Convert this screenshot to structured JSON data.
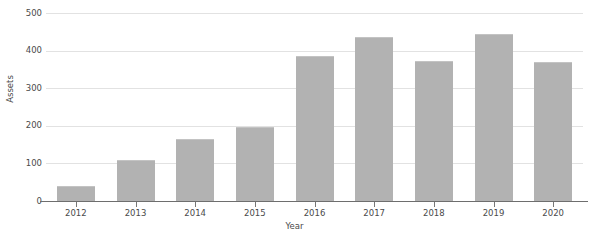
{
  "chart_data": {
    "type": "bar",
    "title": "",
    "xlabel": "Year",
    "ylabel": "Assets",
    "categories": [
      "2012",
      "2013",
      "2014",
      "2015",
      "2016",
      "2017",
      "2018",
      "2019",
      "2020"
    ],
    "values": [
      40,
      110,
      165,
      197,
      385,
      437,
      373,
      443,
      370
    ],
    "series": [
      {
        "name": "Assets",
        "values": [
          40,
          110,
          165,
          197,
          385,
          437,
          373,
          443,
          370
        ]
      }
    ],
    "ylim": [
      0,
      500
    ],
    "ytick_labels": [
      "0",
      "100",
      "200",
      "300",
      "400",
      "500"
    ],
    "ytick_values": [
      0,
      100,
      200,
      300,
      400,
      500
    ],
    "grid": true,
    "grid_axis": "y",
    "legend": false,
    "bar_color": "#b2b2b2",
    "gridline_color": "#e2e2e2",
    "axis_color": "#6e6e6e",
    "text_color": "#4a4a4a"
  }
}
